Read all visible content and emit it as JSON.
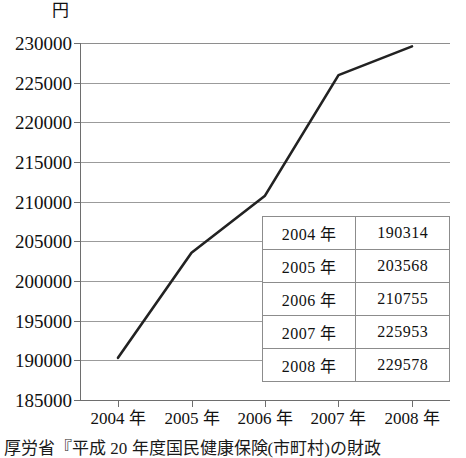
{
  "chart_data": {
    "type": "line",
    "title": "",
    "xlabel": "",
    "ylabel": "円",
    "unit_label": "円",
    "categories": [
      "2004 年",
      "2005 年",
      "2006 年",
      "2007 年",
      "2008 年"
    ],
    "x": [
      2004,
      2005,
      2006,
      2007,
      2008
    ],
    "values": [
      190314,
      203568,
      210755,
      225953,
      229578
    ],
    "series": [
      {
        "name": "",
        "values": [
          190314,
          203568,
          210755,
          225953,
          229578
        ],
        "color": "#222222"
      }
    ],
    "ylim": [
      185000,
      230000
    ],
    "ytick_step": 5000,
    "yticks": [
      230000,
      225000,
      220000,
      215000,
      210000,
      205000,
      200000,
      195000,
      190000,
      185000
    ],
    "ytick_labels": [
      "230000",
      "225000",
      "220000",
      "215000",
      "210000",
      "205000",
      "200000",
      "195000",
      "190000",
      "185000"
    ],
    "xtick_labels": [
      "2004 年",
      "2005 年",
      "2006 年",
      "2007 年",
      "2008 年"
    ],
    "grid": true,
    "grid_axis": "y",
    "legend": false,
    "legend_position": "none",
    "annotation_table": {
      "rows": [
        {
          "year": "2004 年",
          "value": "190314"
        },
        {
          "year": "2005 年",
          "value": "203568"
        },
        {
          "year": "2006 年",
          "value": "210755"
        },
        {
          "year": "2007 年",
          "value": "225953"
        },
        {
          "year": "2008 年",
          "value": "229578"
        }
      ]
    }
  },
  "axis": {
    "unit": "円",
    "ytick_labels": [
      "230000",
      "225000",
      "220000",
      "215000",
      "210000",
      "205000",
      "200000",
      "195000",
      "190000",
      "185000"
    ],
    "xtick_labels": [
      "2004 年",
      "2005 年",
      "2006 年",
      "2007 年",
      "2008 年"
    ]
  },
  "table": {
    "rows": [
      {
        "year": "2004 年",
        "value": "190314"
      },
      {
        "year": "2005 年",
        "value": "203568"
      },
      {
        "year": "2006 年",
        "value": "210755"
      },
      {
        "year": "2007 年",
        "value": "225953"
      },
      {
        "year": "2008 年",
        "value": "229578"
      }
    ]
  },
  "caption": {
    "text": "厚労省『平成 20 年度国民健康保険(市町村)の財政"
  },
  "colors": {
    "line": "#222222",
    "grid": "#9b9b9b",
    "axis": "#6e6e6e",
    "table_border": "#8c8c8c",
    "text": "#111111",
    "background": "#ffffff"
  }
}
